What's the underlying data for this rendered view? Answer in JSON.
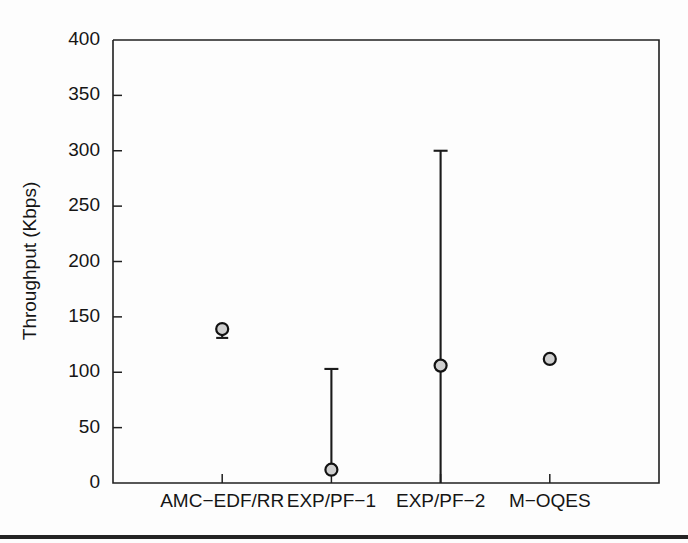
{
  "figure": {
    "background_color": "#fdfdfd",
    "foreground_color": "#151515",
    "marker_fill_color": "#cfcfcf",
    "bottom_rule_color": "#242424"
  },
  "chart_data": {
    "type": "scatter",
    "title": "",
    "subtitle": "",
    "xlabel": "",
    "ylabel": "Throughput (Kbps)",
    "categories": [
      "AMC−EDF/RR",
      "EXP/PF−1",
      "EXP/PF−2",
      "M−OQES"
    ],
    "ylim": [
      0,
      400
    ],
    "yticks": [
      0,
      50,
      100,
      150,
      200,
      250,
      300,
      350,
      400
    ],
    "ytick_labels": [
      "0",
      "50",
      "100",
      "150",
      "200",
      "250",
      "300",
      "350",
      "400"
    ],
    "grid": false,
    "legend": null,
    "series": [
      {
        "name": "Throughput",
        "marker": "circle",
        "values": [
          139,
          12,
          106,
          112
        ],
        "error_low": [
          131,
          12,
          0,
          112
        ],
        "error_high": [
          139,
          103,
          300,
          112
        ],
        "points": [
          {
            "category": "AMC−EDF/RR",
            "value": 139,
            "low": 131,
            "high": 139,
            "has_whisker": true,
            "cap_top": false,
            "cap_bottom": true
          },
          {
            "category": "EXP/PF−1",
            "value": 12,
            "low": 12,
            "high": 103,
            "has_whisker": true,
            "cap_top": true,
            "cap_bottom": true
          },
          {
            "category": "EXP/PF−2",
            "value": 106,
            "low": 0,
            "high": 300,
            "has_whisker": true,
            "cap_top": true,
            "cap_bottom": false
          },
          {
            "category": "M−OQES",
            "value": 112,
            "low": 112,
            "high": 112,
            "has_whisker": false,
            "cap_top": false,
            "cap_bottom": false
          }
        ]
      }
    ]
  }
}
